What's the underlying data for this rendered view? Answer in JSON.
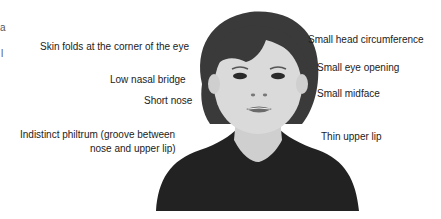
{
  "figure": {
    "left_edge_fragments": [
      "a",
      "l"
    ],
    "labels_left": [
      {
        "id": "epicanthal",
        "text": "Skin folds at the corner of the eye"
      },
      {
        "id": "nasal_bridge",
        "text": "Low nasal bridge"
      },
      {
        "id": "short_nose",
        "text": "Short nose"
      },
      {
        "id": "philtrum_line1",
        "text": "Indistinct philtrum (groove between"
      },
      {
        "id": "philtrum_line2",
        "text": "nose and upper lip)"
      }
    ],
    "labels_right": [
      {
        "id": "head_circ",
        "text": "Small head circumference"
      },
      {
        "id": "eye_opening",
        "text": "Small eye opening"
      },
      {
        "id": "midface",
        "text": "Small midface"
      },
      {
        "id": "upper_lip",
        "text": "Thin upper lip"
      }
    ],
    "portrait": {
      "subject": "child face illustration",
      "colors": {
        "hair": "#3a3a3a",
        "skin": "#d9d9d9",
        "shirt": "#222222",
        "lips": "#6a6a6a"
      }
    }
  }
}
